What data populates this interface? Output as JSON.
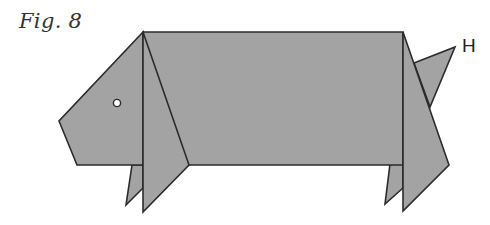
{
  "figure": {
    "caption": "Fig. 8",
    "point_labels": [
      {
        "id": "H",
        "text": "H",
        "x": 462,
        "y": 35
      }
    ],
    "colors": {
      "fill": "#a3a3a3",
      "stroke": "#2b2b2b",
      "eye_fill": "#ffffff",
      "background": "#ffffff"
    },
    "shapes": {
      "tail": {
        "points": "414,63 455,47 430,107"
      },
      "back_leg_left": {
        "points": "132,165 143,165 143,188 126,205"
      },
      "back_leg_right": {
        "points": "390,164 403,164 403,188 385,204"
      },
      "body": {
        "points": "143,32 403,32 403,165 143,165"
      },
      "head": {
        "points": "143,32 143,165 77,165 59,121"
      },
      "front_fold_left": {
        "points": "143,32 189,165 143,212"
      },
      "front_fold_right": {
        "points": "403,32 449,165 403,211"
      }
    },
    "eye": {
      "cx": 117,
      "cy": 103,
      "r": 3.6
    }
  }
}
